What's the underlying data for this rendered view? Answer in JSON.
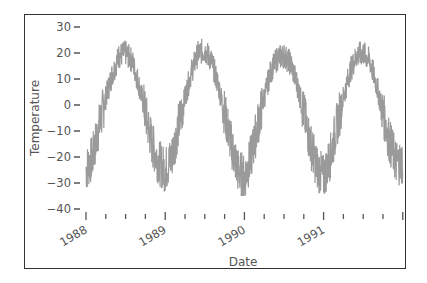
{
  "chart_data": {
    "type": "line",
    "title": "",
    "xlabel": "Date",
    "ylabel": "Temperature",
    "ylim": [
      -40,
      30
    ],
    "yticks": [
      30,
      20,
      10,
      0,
      -10,
      -20,
      -30,
      -40
    ],
    "xticks": [
      "1988",
      "1989",
      "1990",
      "1991"
    ],
    "xrange": [
      "1988-01",
      "1992-01"
    ],
    "grid": false,
    "legend": null,
    "line_color": "#999999",
    "series": [
      {
        "name": "Temperature",
        "description": "Daily temperature with annual seasonal cycle, peaks ~20-26 in summer, troughs ~-25 to -35 in winter",
        "x": [
          "1988-01",
          "1988-02",
          "1988-03",
          "1988-04",
          "1988-05",
          "1988-06",
          "1988-07",
          "1988-08",
          "1988-09",
          "1988-10",
          "1988-11",
          "1988-12",
          "1989-01",
          "1989-02",
          "1989-03",
          "1989-04",
          "1989-05",
          "1989-06",
          "1989-07",
          "1989-08",
          "1989-09",
          "1989-10",
          "1989-11",
          "1989-12",
          "1990-01",
          "1990-02",
          "1990-03",
          "1990-04",
          "1990-05",
          "1990-06",
          "1990-07",
          "1990-08",
          "1990-09",
          "1990-10",
          "1990-11",
          "1990-12",
          "1991-01",
          "1991-02",
          "1991-03",
          "1991-04",
          "1991-05",
          "1991-06",
          "1991-07",
          "1991-08",
          "1991-09",
          "1991-10",
          "1991-11",
          "1991-12"
        ],
        "values": [
          -25,
          -20,
          -8,
          3,
          12,
          19,
          20,
          17,
          8,
          -3,
          -15,
          -22,
          -25,
          -20,
          -8,
          3,
          13,
          20,
          21,
          17,
          8,
          -3,
          -15,
          -25,
          -28,
          -20,
          -8,
          3,
          13,
          18,
          19,
          16,
          8,
          -3,
          -15,
          -24,
          -28,
          -20,
          -8,
          3,
          13,
          19,
          20,
          17,
          8,
          -3,
          -14,
          -22
        ]
      }
    ]
  },
  "axes": {
    "ylabel": "Temperature",
    "xlabel": "Date",
    "yticks": [
      "30",
      "20",
      "10",
      "0",
      "−10",
      "−20",
      "−30",
      "−40"
    ],
    "xticks": [
      "1988",
      "1989",
      "1990",
      "1991"
    ]
  }
}
